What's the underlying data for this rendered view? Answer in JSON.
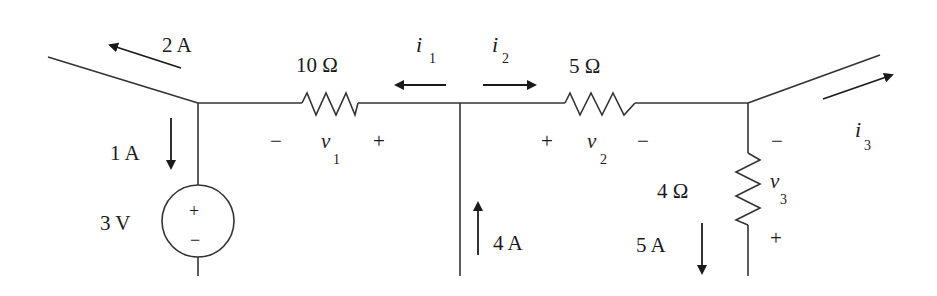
{
  "diagram": {
    "type": "circuit",
    "components": {
      "r1": {
        "label": "10 Ω",
        "voltage_label": "v",
        "voltage_sub": "1",
        "minus": "−",
        "plus": "+"
      },
      "r2": {
        "label": "5 Ω",
        "voltage_label": "v",
        "voltage_sub": "2",
        "plus": "+",
        "minus": "−"
      },
      "r3": {
        "label": "4 Ω",
        "voltage_label": "v",
        "voltage_sub": "3",
        "minus": "−",
        "plus": "+"
      },
      "vsource": {
        "label": "3 V",
        "plus": "+",
        "minus": "−"
      }
    },
    "currents": {
      "left_branch": {
        "label": "2 A",
        "direction": "up-left"
      },
      "source_branch": {
        "label": "1 A",
        "direction": "down"
      },
      "middle_branch": {
        "label": "4 A",
        "direction": "up"
      },
      "r3_branch": {
        "label": "5 A",
        "direction": "down"
      },
      "i1": {
        "label": "i",
        "sub": "1",
        "direction": "left"
      },
      "i2": {
        "label": "i",
        "sub": "2",
        "direction": "right"
      },
      "i3": {
        "label": "i",
        "sub": "3",
        "direction": "up-right"
      }
    }
  }
}
